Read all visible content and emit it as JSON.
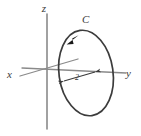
{
  "figure": {
    "type": "vector-diagram",
    "width": 141,
    "height": 136,
    "background_color": "#ffffff"
  },
  "colors": {
    "axis_stroke": "#8a8a8a",
    "curve_stroke": "#3c3c3c",
    "arrow_fill": "#1a1a1a",
    "label_fill": "#3a3a3a",
    "dim_stroke": "#4a4a4a"
  },
  "axes": [
    {
      "name": "z",
      "label": "z",
      "label_x": 44,
      "label_y": 12,
      "x1": 47,
      "y1": 14,
      "x2": 47,
      "y2": 129
    },
    {
      "name": "x",
      "label": "x",
      "label_x": 7,
      "label_y": 78,
      "x1": 20,
      "y1": 76,
      "x2": 78,
      "y2": 59
    },
    {
      "name": "y",
      "label": "y",
      "label_x": 126,
      "label_y": 77,
      "x1": 22,
      "y1": 68,
      "x2": 126,
      "y2": 73
    }
  ],
  "curve": {
    "name": "C",
    "label": "C",
    "label_x": 82,
    "label_y": 23,
    "center_x": 86,
    "center_y": 73,
    "radius_x": 27,
    "radius_y": 43,
    "rotation_deg": -8,
    "orientation": "counterclockwise",
    "arrow_x": 72,
    "arrow_y": 41
  },
  "dimension": {
    "name": "radius-dimension",
    "label": "2",
    "label_x": 77,
    "label_y": 80,
    "x1": 64,
    "y1": 81,
    "x2": 95,
    "y2": 72
  }
}
